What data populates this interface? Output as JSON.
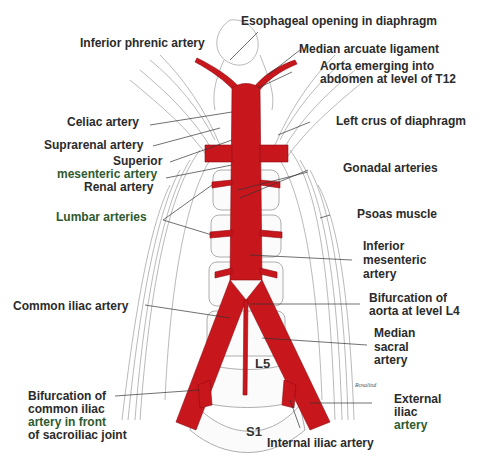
{
  "diagram": {
    "colors": {
      "artery": "#c8161d",
      "artery_dark": "#8e0c10",
      "muscle_line": "#7a7a7a",
      "label_text": "#2b2b2b",
      "background": "#ffffff"
    },
    "labels": {
      "esophageal_opening": "Esophageal opening in diaphragm",
      "inferior_phrenic": "Inferior phrenic artery",
      "median_arcuate": "Median arcuate ligament",
      "aorta_emerging_1": "Aorta emerging into",
      "aorta_emerging_2": "abdomen at level of T12",
      "celiac": "Celiac artery",
      "left_crus": "Left crus of diaphragm",
      "suprarenal": "Suprarenal artery",
      "superior_mesenteric_1": "Superior",
      "superior_mesenteric_2": "mesenteric artery",
      "renal": "Renal artery",
      "gonadal": "Gonadal arteries",
      "lumbar": "Lumbar arteries",
      "psoas": "Psoas muscle",
      "inferior_mesenteric_1": "Inferior",
      "inferior_mesenteric_2": "mesenteric",
      "inferior_mesenteric_3": "artery",
      "common_iliac": "Common iliac artery",
      "bifurcation_aorta_1": "Bifurcation of",
      "bifurcation_aorta_2": "aorta at level L4",
      "median_sacral_1": "Median",
      "median_sacral_2": "sacral",
      "median_sacral_3": "artery",
      "bifurcation_common_1": "Bifurcation of",
      "bifurcation_common_2": "common iliac",
      "bifurcation_common_3": "artery in front",
      "bifurcation_common_4": "of sacroiliac joint",
      "external_iliac_1": "External",
      "external_iliac_2": "iliac",
      "external_iliac_3": "artery",
      "internal_iliac": "Internal iliac artery"
    },
    "vertebrae": {
      "l5": "L5",
      "s1": "S1"
    },
    "signature": "Rosalind"
  }
}
